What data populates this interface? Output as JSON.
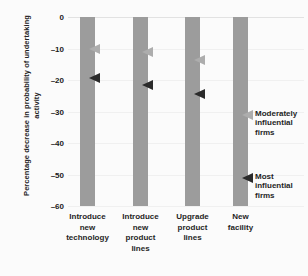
{
  "chart_data": {
    "type": "bar",
    "title": "",
    "xlabel": "",
    "ylabel": "Percentage decrease in probability of undertaking activity",
    "ylim": [
      -60,
      0
    ],
    "yticks": [
      0,
      -10,
      -20,
      -30,
      -40,
      -50,
      -60
    ],
    "ytick_labels": [
      "0",
      "–10",
      "–20",
      "–30",
      "–40",
      "–50",
      "–60"
    ],
    "categories": [
      "Introduce new technology",
      "Introduce new product lines",
      "Upgrade product lines",
      "New facility"
    ],
    "category_lines": [
      [
        "Introduce",
        "new",
        "technology"
      ],
      [
        "Introduce",
        "new",
        "product",
        "lines"
      ],
      [
        "Upgrade",
        "product",
        "lines"
      ],
      [
        "New",
        "facility"
      ]
    ],
    "grid": true,
    "legend_position": "inline-annotation",
    "series": [
      {
        "name": "Moderately influential firms",
        "marker": "left-arrow",
        "color": "#adadad",
        "values": [
          -10,
          -11,
          -13.5,
          -31
        ]
      },
      {
        "name": "Most influential firms",
        "marker": "left-arrow",
        "color": "#2b2b2b",
        "values": [
          -19.5,
          -21.5,
          -24.5,
          -51
        ]
      }
    ],
    "bar_color": "#9c9c9c",
    "background_color": "#fbfbfb",
    "annotations": [
      {
        "id": "moderately-influential-firms",
        "lines": [
          "Moderately",
          "influential",
          "firms"
        ],
        "value": -31
      },
      {
        "id": "most-influential-firms",
        "lines": [
          "Most",
          "influential",
          "firms"
        ],
        "value": -51
      }
    ]
  }
}
